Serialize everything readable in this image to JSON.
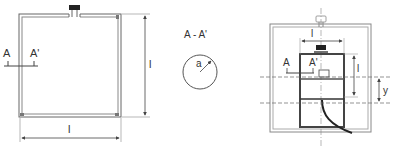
{
  "figure_left": {
    "section_label_a": "A",
    "section_label_a_prime": "A'",
    "dim_height": "l",
    "dim_width": "l"
  },
  "figure_middle": {
    "section_title": "A - A'",
    "radius_label": "a"
  },
  "figure_right": {
    "dim_width": "l",
    "dim_height": "l",
    "dim_offset": "y",
    "section_label_a": "A",
    "section_label_a_prime": "A'"
  },
  "colors": {
    "line": "#555555",
    "dark": "#222222",
    "light_line": "#999999"
  }
}
